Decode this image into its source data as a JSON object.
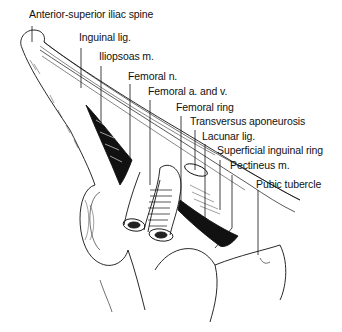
{
  "figure": {
    "labels": [
      {
        "id": "asis",
        "text": "Anterior-superior iliac spine",
        "x": 29,
        "y": 14
      },
      {
        "id": "inguinal_lig",
        "text": "Inguinal lig.",
        "x": 79,
        "y": 36
      },
      {
        "id": "iliopsoas",
        "text": "Iliopsoas m.",
        "x": 99,
        "y": 54
      },
      {
        "id": "femoral_n",
        "text": "Femoral n.",
        "x": 128,
        "y": 72
      },
      {
        "id": "femoral_av",
        "text": "Femoral a. and v.",
        "x": 148,
        "y": 88
      },
      {
        "id": "femoral_ring",
        "text": "Femoral ring",
        "x": 176,
        "y": 104
      },
      {
        "id": "transversus",
        "text": "Transversus aponeurosis",
        "x": 190,
        "y": 118
      },
      {
        "id": "lacunar",
        "text": "Lacunar lig.",
        "x": 202,
        "y": 133
      },
      {
        "id": "superficial_ring",
        "text": "Superficial inguinal ring",
        "x": 217,
        "y": 148
      },
      {
        "id": "pectineus",
        "text": "Pectineus m.",
        "x": 230,
        "y": 163
      },
      {
        "id": "pubic_tubercle",
        "text": "Pubic tubercle",
        "x": 256,
        "y": 180
      }
    ]
  }
}
